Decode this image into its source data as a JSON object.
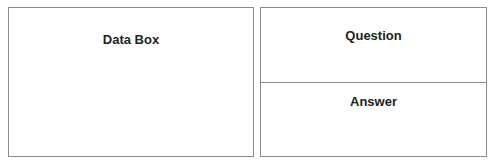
{
  "left_panel": {
    "title": "Data Box"
  },
  "right_panel": {
    "question_title": "Question",
    "answer_title": "Answer"
  }
}
